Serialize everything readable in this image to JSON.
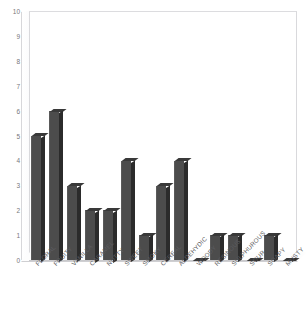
{
  "top_cut_text": {
    "left": "",
    "right": ""
  },
  "chart_data": {
    "type": "bar",
    "title": "",
    "xlabel": "",
    "ylabel": "",
    "ylim": [
      0,
      10
    ],
    "yticks": [
      10,
      9,
      8,
      7,
      6,
      5,
      4,
      3,
      2,
      1,
      0
    ],
    "grid": false,
    "legend": false,
    "style": "3d-column",
    "bar_color": "#4c4c4c",
    "bar_side_color": "#2b2b2b",
    "bar_top_color": "#393939",
    "plot_background": "#ffffff",
    "axis_color": "#d9d9dc",
    "tick_label_color": "#77777b",
    "categories": [
      "FLORAL",
      "FRUITY",
      "VANILLA",
      "CARAMEL",
      "NUTTY",
      "SWEET",
      "SMOKY",
      "CEREAL",
      "ALDEHYDIC",
      "WOODY",
      "RESINOUS",
      "SULPHUROUS",
      "SOUR",
      "SOAPY",
      "MUSTY"
    ],
    "values": [
      5,
      6,
      3,
      2,
      2,
      4,
      1,
      3,
      4,
      0,
      1,
      1,
      0,
      1,
      0
    ]
  }
}
